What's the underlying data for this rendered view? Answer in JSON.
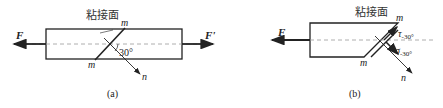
{
  "figure_a": {
    "caption": "(a)",
    "bond_label": "粘接面",
    "force_left": "F",
    "force_right": "F'",
    "section_top": "m",
    "section_bottom": "m",
    "normal_label": "n",
    "angle_label": "30°"
  },
  "figure_b": {
    "caption": "(b)",
    "bond_label": "粘接面",
    "force_left": "F",
    "section_top": "m",
    "section_bottom": "m",
    "normal_label": "n",
    "shear_stress_label": "τ",
    "shear_stress_sub": "-30°",
    "normal_stress_label": "σ",
    "normal_stress_sub": "-30°"
  },
  "colors": {
    "stroke": "#222222",
    "dash": "#999999"
  }
}
